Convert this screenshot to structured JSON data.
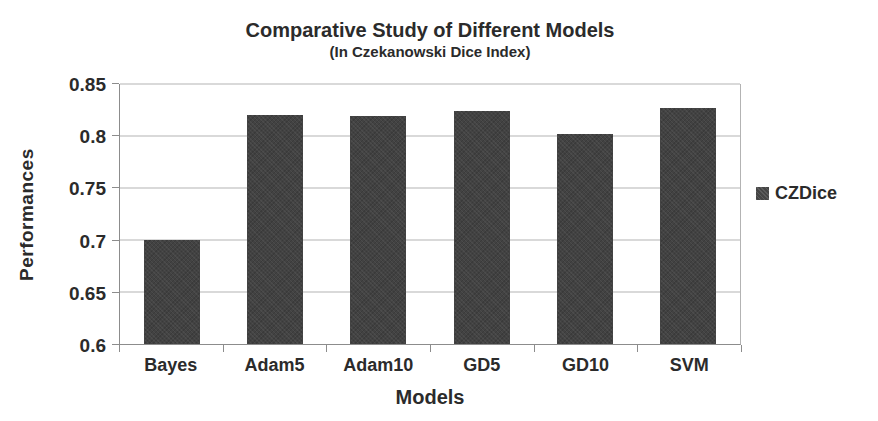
{
  "chart_data": {
    "type": "bar",
    "title": "Comparative Study of Different Models",
    "subtitle": "(In Czekanowski Dice Index)",
    "xlabel": "Models",
    "ylabel": "Performances",
    "categories": [
      "Bayes",
      "Adam5",
      "Adam10",
      "GD5",
      "GD10",
      "SVM"
    ],
    "series": [
      {
        "name": "CZDice",
        "values": [
          0.7,
          0.82,
          0.819,
          0.824,
          0.802,
          0.827
        ]
      }
    ],
    "ylim": [
      0.6,
      0.85
    ],
    "yticks": [
      0.6,
      0.65,
      0.7,
      0.75,
      0.8,
      0.85
    ],
    "ytick_labels": [
      "0.6",
      "0.65",
      "0.7",
      "0.75",
      "0.8",
      "0.85"
    ],
    "grid": true,
    "legend": {
      "position": "right",
      "entries": [
        "CZDice"
      ]
    },
    "colors": {
      "bar": "#424242",
      "legend_marker": "#454545",
      "gridline": "#b3b3b3",
      "axis": "#8c8c8c",
      "text": "#2b2b2b"
    }
  }
}
